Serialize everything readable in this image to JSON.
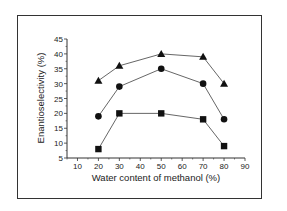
{
  "chart_data": {
    "type": "line",
    "title": "",
    "xlabel": "Water content of methanol (%)",
    "ylabel": "Enantioselectivity (%)",
    "xlim": [
      5,
      90
    ],
    "ylim": [
      5,
      45
    ],
    "x_ticks": [
      10,
      20,
      30,
      40,
      50,
      60,
      70,
      80,
      90
    ],
    "y_ticks": [
      5,
      10,
      15,
      20,
      25,
      30,
      35,
      40,
      45
    ],
    "grid": false,
    "legend": null,
    "x": [
      20,
      30,
      50,
      70,
      80
    ],
    "series": [
      {
        "name": "triangle series",
        "marker": "triangle",
        "values": [
          31,
          36,
          40,
          39,
          30
        ]
      },
      {
        "name": "circle series",
        "marker": "circle",
        "values": [
          19,
          29,
          35,
          30,
          18
        ]
      },
      {
        "name": "square series",
        "marker": "square",
        "values": [
          8,
          20,
          20,
          18,
          9
        ]
      }
    ]
  },
  "colors": {
    "line": "#555555",
    "marker": "#111111",
    "axis": "#333333"
  }
}
